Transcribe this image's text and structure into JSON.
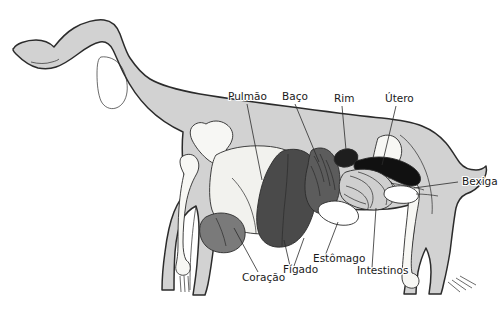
{
  "figure": {
    "language": "pt",
    "background_color": "#ffffff",
    "width": 500,
    "height": 315
  },
  "palette": {
    "body_fill": "#d2d2d2",
    "body_outline": "#2b2b2b",
    "bone_fill": "#f7f7f4",
    "lung_fill": "#f2f2ee",
    "liver_fill": "#4a4a4a",
    "spleen_fill": "#5c5c5c",
    "heart_fill": "#7a7a7a",
    "kidney_fill": "#1e1e1e",
    "uterus_fill": "#111111",
    "intestine_fill": "#cfcfcf",
    "stomach_fill": "#ffffff",
    "bladder_fill": "#ffffff",
    "label_color": "#1a1a1a",
    "leader_color": "#2b2b2b"
  },
  "labels": [
    {
      "id": "pulmao",
      "text": "Pulmão",
      "x": 228,
      "y": 100,
      "anchor": "start",
      "organ": "lung"
    },
    {
      "id": "baco",
      "text": "Baço",
      "x": 282,
      "y": 100,
      "anchor": "start",
      "organ": "spleen"
    },
    {
      "id": "rim",
      "text": "Rim",
      "x": 334,
      "y": 102,
      "anchor": "start",
      "organ": "kidney"
    },
    {
      "id": "utero",
      "text": "Útero",
      "x": 385,
      "y": 102,
      "anchor": "start",
      "organ": "uterus"
    },
    {
      "id": "bexiga",
      "text": "Bexiga",
      "x": 462,
      "y": 185,
      "anchor": "start",
      "organ": "bladder"
    },
    {
      "id": "coracao",
      "text": "Coração",
      "x": 242,
      "y": 281,
      "anchor": "start",
      "organ": "heart"
    },
    {
      "id": "figado",
      "text": "Fígado",
      "x": 283,
      "y": 273,
      "anchor": "start",
      "organ": "liver"
    },
    {
      "id": "estomago",
      "text": "Estômago",
      "x": 313,
      "y": 262,
      "anchor": "start",
      "organ": "stomach"
    },
    {
      "id": "intestinos",
      "text": "Intestinos",
      "x": 357,
      "y": 274,
      "anchor": "start",
      "organ": "intestines"
    }
  ],
  "organs": [
    {
      "id": "lung",
      "label": "Pulmão",
      "color": "#f2f2ee"
    },
    {
      "id": "spleen",
      "label": "Baço",
      "color": "#5c5c5c"
    },
    {
      "id": "kidney",
      "label": "Rim",
      "color": "#1e1e1e"
    },
    {
      "id": "uterus",
      "label": "Útero",
      "color": "#111111"
    },
    {
      "id": "bladder",
      "label": "Bexiga",
      "color": "#ffffff"
    },
    {
      "id": "heart",
      "label": "Coração",
      "color": "#7a7a7a"
    },
    {
      "id": "liver",
      "label": "Fígado",
      "color": "#4a4a4a"
    },
    {
      "id": "stomach",
      "label": "Estômago",
      "color": "#ffffff"
    },
    {
      "id": "intestines",
      "label": "Intestinos",
      "color": "#cfcfcf"
    }
  ]
}
